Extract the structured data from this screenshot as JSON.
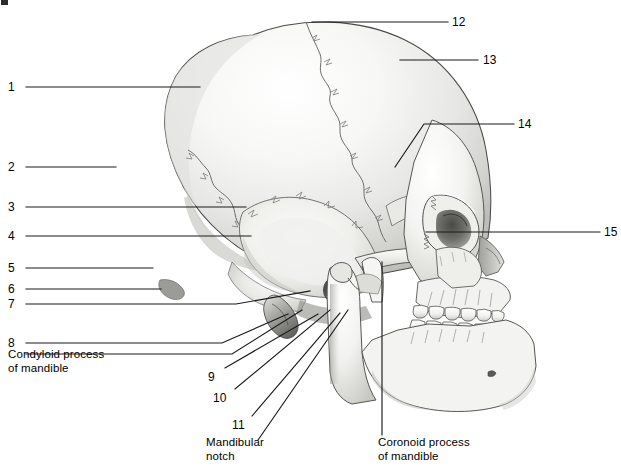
{
  "figure": {
    "background_color": "#ffffff",
    "line_color": "#1a1a1a",
    "text_color": "#000000",
    "width": 621,
    "height": 473
  },
  "corner_mark": {
    "name": "figure-corner-mark",
    "visible": true
  },
  "numbered_labels": [
    {
      "id": "label-1",
      "text": "1",
      "x": 8,
      "y": 81,
      "side": "left"
    },
    {
      "id": "label-2",
      "text": "2",
      "x": 8,
      "y": 161,
      "side": "left"
    },
    {
      "id": "label-3",
      "text": "3",
      "x": 8,
      "y": 201,
      "side": "left"
    },
    {
      "id": "label-4",
      "text": "4",
      "x": 8,
      "y": 230,
      "side": "left"
    },
    {
      "id": "label-5",
      "text": "5",
      "x": 8,
      "y": 262,
      "side": "left"
    },
    {
      "id": "label-6",
      "text": "6",
      "x": 8,
      "y": 283,
      "side": "left"
    },
    {
      "id": "label-7",
      "text": "7",
      "x": 8,
      "y": 298,
      "side": "left"
    },
    {
      "id": "label-8",
      "text": "8",
      "x": 8,
      "y": 337,
      "side": "left"
    },
    {
      "id": "label-9",
      "text": "9",
      "x": 208,
      "y": 371,
      "side": "bottom"
    },
    {
      "id": "label-10",
      "text": "10",
      "x": 213,
      "y": 392,
      "side": "bottom"
    },
    {
      "id": "label-11",
      "text": "11",
      "x": 232,
      "y": 419,
      "side": "bottom"
    },
    {
      "id": "label-12",
      "text": "12",
      "x": 452,
      "y": 16,
      "side": "right"
    },
    {
      "id": "label-13",
      "text": "13",
      "x": 483,
      "y": 54,
      "side": "right"
    },
    {
      "id": "label-14",
      "text": "14",
      "x": 518,
      "y": 118,
      "side": "right"
    },
    {
      "id": "label-15",
      "text": "15",
      "x": 604,
      "y": 226,
      "side": "right"
    }
  ],
  "named_labels": [
    {
      "id": "condyloid-process-label",
      "lines": [
        "Condyloid process",
        "of mandible"
      ],
      "x": 8,
      "y": 348,
      "side": "left"
    },
    {
      "id": "mandibular-notch-label",
      "lines": [
        "Mandibular",
        "notch"
      ],
      "x": 206,
      "y": 436,
      "side": "bottom"
    },
    {
      "id": "coronoid-process-label",
      "lines": [
        "Coronoid process",
        "of mandible"
      ],
      "x": 378,
      "y": 436,
      "side": "bottom"
    }
  ],
  "leader_lines": [
    {
      "id": "leader-1",
      "points": "26,87 200,87"
    },
    {
      "id": "leader-2",
      "points": "26,167 116,167"
    },
    {
      "id": "leader-3",
      "points": "26,207 246,207"
    },
    {
      "id": "leader-4",
      "points": "26,236 251,236"
    },
    {
      "id": "leader-5",
      "points": "26,268 153,268"
    },
    {
      "id": "leader-6",
      "points": "26,289 161,289"
    },
    {
      "id": "leader-7",
      "points": "26,304 236,304 310,291"
    },
    {
      "id": "leader-8",
      "points": "26,343 222,343 288,314"
    },
    {
      "id": "leader-9",
      "points": "26,354 232,354 302,310"
    },
    {
      "id": "leader-10",
      "points": "225,368 318,314"
    },
    {
      "id": "leader-11",
      "points": "235,389 330,310"
    },
    {
      "id": "leader-12",
      "points": "252,416 340,313"
    },
    {
      "id": "leader-13",
      "points": "258,440 348,310"
    },
    {
      "id": "leader-14",
      "points": "448,22 312,22"
    },
    {
      "id": "leader-15",
      "points": "478,60 400,60"
    },
    {
      "id": "leader-16",
      "points": "514,124 424,124 395,167"
    },
    {
      "id": "leader-17",
      "points": "600,232 426,232"
    },
    {
      "id": "leader-18",
      "points": "382,435 382,262"
    }
  ],
  "anatomy_notes": {
    "view": "lateral (left side)",
    "visible_structures": [
      "cranial vault",
      "coronal suture",
      "squamous suture",
      "lambdoid suture",
      "temporal bone",
      "mastoid process",
      "external acoustic meatus",
      "zygomatic arch",
      "orbit",
      "maxilla",
      "mandible",
      "mandibular ramus",
      "coronoid process",
      "condyloid process",
      "mandibular notch",
      "upper and lower tooth rows"
    ]
  }
}
